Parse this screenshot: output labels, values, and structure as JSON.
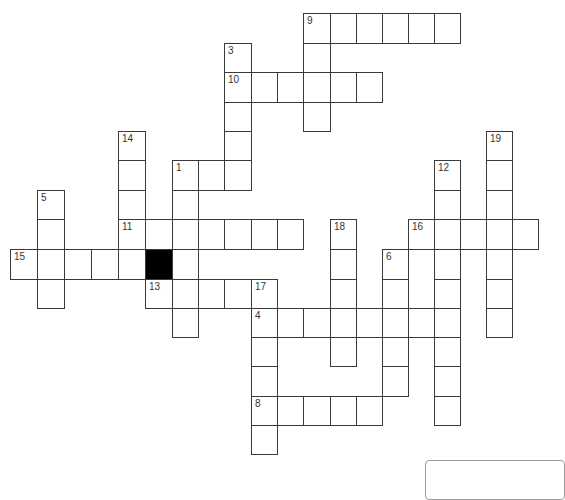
{
  "puzzle": {
    "type": "crossword",
    "grid_origin": {
      "x": 10,
      "y": 13
    },
    "col_x": [
      10,
      37,
      64,
      91,
      118,
      145,
      172,
      198,
      224,
      251,
      277,
      303,
      330,
      356,
      382,
      408,
      434,
      460,
      486,
      512,
      538
    ],
    "row_y": [
      13,
      43,
      72,
      102,
      131,
      160,
      190,
      219,
      249,
      279,
      308,
      337,
      366,
      396,
      425,
      454
    ],
    "black_cells": [
      [
        5,
        8
      ]
    ],
    "entries": [
      {
        "number": "9",
        "direction": "across",
        "col": 11,
        "row": 0,
        "length": 6
      },
      {
        "number": "9",
        "direction": "down",
        "col": 11,
        "row": 0,
        "length": 4
      },
      {
        "number": "3",
        "direction": "down",
        "col": 8,
        "row": 1,
        "length": 5
      },
      {
        "number": "10",
        "direction": "across",
        "col": 8,
        "row": 2,
        "length": 6
      },
      {
        "number": "14",
        "direction": "down",
        "col": 4,
        "row": 4,
        "length": 5
      },
      {
        "number": "19",
        "direction": "down",
        "col": 18,
        "row": 4,
        "length": 7
      },
      {
        "number": "1",
        "direction": "across",
        "col": 6,
        "row": 5,
        "length": 3
      },
      {
        "number": "1",
        "direction": "down",
        "col": 6,
        "row": 5,
        "length": 6
      },
      {
        "number": "12",
        "direction": "down",
        "col": 16,
        "row": 5,
        "length": 9
      },
      {
        "number": "5",
        "direction": "down",
        "col": 1,
        "row": 6,
        "length": 4
      },
      {
        "number": "11",
        "direction": "across",
        "col": 4,
        "row": 7,
        "length": 7
      },
      {
        "number": "18",
        "direction": "down",
        "col": 12,
        "row": 7,
        "length": 5
      },
      {
        "number": "16",
        "direction": "across",
        "col": 15,
        "row": 7,
        "length": 5
      },
      {
        "number": "15",
        "direction": "across",
        "col": 0,
        "row": 8,
        "length": 5
      },
      {
        "number": "6",
        "direction": "down",
        "col": 14,
        "row": 8,
        "length": 5
      },
      {
        "number": "13",
        "direction": "across",
        "col": 5,
        "row": 9,
        "length": 5
      },
      {
        "number": "17",
        "direction": "down",
        "col": 9,
        "row": 9,
        "length": 6
      },
      {
        "number": "4",
        "direction": "across",
        "col": 9,
        "row": 10,
        "length": 8
      },
      {
        "number": "8",
        "direction": "across",
        "col": 9,
        "row": 13,
        "length": 5
      }
    ],
    "labels": [
      {
        "number": "9",
        "col": 11,
        "row": 0
      },
      {
        "number": "3",
        "col": 8,
        "row": 1
      },
      {
        "number": "10",
        "col": 8,
        "row": 2
      },
      {
        "number": "14",
        "col": 4,
        "row": 4
      },
      {
        "number": "19",
        "col": 18,
        "row": 4
      },
      {
        "number": "1",
        "col": 6,
        "row": 5
      },
      {
        "number": "12",
        "col": 16,
        "row": 5
      },
      {
        "number": "5",
        "col": 1,
        "row": 6
      },
      {
        "number": "11",
        "col": 4,
        "row": 7
      },
      {
        "number": "18",
        "col": 12,
        "row": 7
      },
      {
        "number": "16",
        "col": 15,
        "row": 7
      },
      {
        "number": "15",
        "col": 0,
        "row": 8
      },
      {
        "number": "6",
        "col": 14,
        "row": 8
      },
      {
        "number": "13",
        "col": 5,
        "row": 9
      },
      {
        "number": "17",
        "col": 9,
        "row": 9
      },
      {
        "number": "4",
        "col": 9,
        "row": 10
      },
      {
        "number": "8",
        "col": 9,
        "row": 13
      }
    ]
  },
  "colors": {
    "grid_line": "#3a3a3a",
    "cell_fill": "#ffffff",
    "black_cell": "#000000",
    "number_text": "#333333",
    "wordbank_border": "#9a9a9a"
  }
}
